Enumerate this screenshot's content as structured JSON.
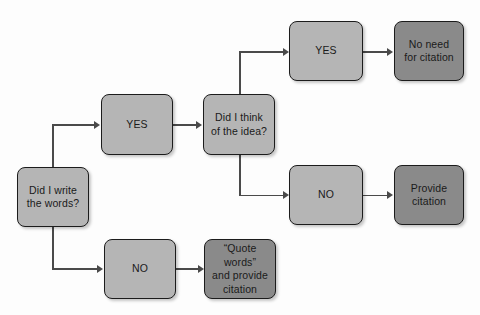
{
  "diagram": {
    "background_color": "#fdfdfd",
    "colors": {
      "node_light": "#b5b5b5",
      "node_dark": "#8a8a8a",
      "node_border": "#1c1c1c",
      "connector": "#4a4a4a",
      "text": "#1a1a1a"
    },
    "nodes": [
      {
        "id": "did-i-write-the-words",
        "label": "Did I write\nthe words?",
        "shape": "rounded-rect",
        "fill": "light",
        "x": 17,
        "y": 167,
        "w": 72,
        "h": 60
      },
      {
        "id": "yes-wrote-words",
        "label": "YES",
        "shape": "rounded-rect",
        "fill": "light",
        "x": 101,
        "y": 94,
        "w": 72,
        "h": 61
      },
      {
        "id": "no-wrote-words",
        "label": "NO",
        "shape": "rounded-rect",
        "fill": "light",
        "x": 104,
        "y": 239,
        "w": 72,
        "h": 60
      },
      {
        "id": "did-i-think-of-the-idea",
        "label": "Did I think\nof the idea?",
        "shape": "rounded-rect",
        "fill": "light",
        "x": 203,
        "y": 94,
        "w": 72,
        "h": 61
      },
      {
        "id": "quote-words-and-provide-citation",
        "label": "“Quote words”\nand provide\ncitation",
        "shape": "rounded-rect",
        "fill": "dark",
        "x": 204,
        "y": 239,
        "w": 72,
        "h": 60
      },
      {
        "id": "yes-thought-of-idea",
        "label": "YES",
        "shape": "rounded-rect",
        "fill": "light",
        "x": 289,
        "y": 21,
        "w": 74,
        "h": 60
      },
      {
        "id": "no-thought-of-idea",
        "label": "NO",
        "shape": "rounded-rect",
        "fill": "light",
        "x": 289,
        "y": 165,
        "w": 74,
        "h": 60
      },
      {
        "id": "no-need-for-citation",
        "label": "No need\nfor citation",
        "shape": "rounded-rect",
        "fill": "dark",
        "x": 394,
        "y": 21,
        "w": 70,
        "h": 60
      },
      {
        "id": "provide-citation",
        "label": "Provide\ncitation",
        "shape": "rounded-rect",
        "fill": "dark",
        "x": 394,
        "y": 165,
        "w": 70,
        "h": 60
      }
    ],
    "edges": [
      {
        "id": "edge-write-to-yes",
        "from": "did-i-write-the-words",
        "to": "yes-wrote-words",
        "type": "elbow-up"
      },
      {
        "id": "edge-write-to-no",
        "from": "did-i-write-the-words",
        "to": "no-wrote-words",
        "type": "elbow-down"
      },
      {
        "id": "edge-yes-to-think",
        "from": "yes-wrote-words",
        "to": "did-i-think-of-the-idea",
        "type": "straight"
      },
      {
        "id": "edge-no-to-quote",
        "from": "no-wrote-words",
        "to": "quote-words-and-provide-citation",
        "type": "straight"
      },
      {
        "id": "edge-think-to-yes",
        "from": "did-i-think-of-the-idea",
        "to": "yes-thought-of-idea",
        "type": "elbow-up"
      },
      {
        "id": "edge-think-to-no",
        "from": "did-i-think-of-the-idea",
        "to": "no-thought-of-idea",
        "type": "elbow-down"
      },
      {
        "id": "edge-yes-to-noneed",
        "from": "yes-thought-of-idea",
        "to": "no-need-for-citation",
        "type": "straight"
      },
      {
        "id": "edge-no-to-provide",
        "from": "no-thought-of-idea",
        "to": "provide-citation",
        "type": "straight"
      }
    ]
  }
}
